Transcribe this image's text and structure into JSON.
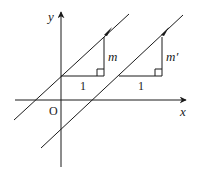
{
  "diagram": {
    "axes": {
      "x_label": "x",
      "y_label": "y",
      "origin_label": "O"
    },
    "triangles": [
      {
        "run_label": "1",
        "rise_label": "m"
      },
      {
        "run_label": "1",
        "rise_label": "m′"
      }
    ],
    "colors": {
      "ink": "#1a1a1a",
      "background": "#ffffff"
    }
  }
}
